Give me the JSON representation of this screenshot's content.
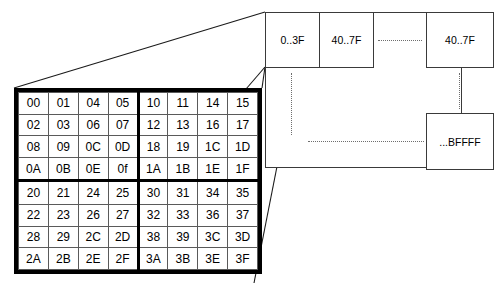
{
  "diagram": {
    "colors": {
      "outline": "#000000",
      "cell_border": "#5a5a5a",
      "panel_border": "#3a3a3a",
      "dotted": "#6e6e6e",
      "background": "#ffffff"
    }
  },
  "hex_grid": {
    "name": "address-block-grid",
    "rows": 8,
    "columns": 8,
    "quadrant_divider_after_column": 4,
    "quadrant_divider_after_row": 4,
    "cells": [
      [
        "00",
        "01",
        "04",
        "05",
        "10",
        "11",
        "14",
        "15"
      ],
      [
        "02",
        "03",
        "06",
        "07",
        "12",
        "13",
        "16",
        "17"
      ],
      [
        "08",
        "09",
        "0C",
        "0D",
        "18",
        "19",
        "1C",
        "1D"
      ],
      [
        "0A",
        "0B",
        "0E",
        "0f",
        "1A",
        "1B",
        "1E",
        "1F"
      ],
      [
        "20",
        "21",
        "24",
        "25",
        "30",
        "31",
        "34",
        "35"
      ],
      [
        "22",
        "23",
        "26",
        "27",
        "32",
        "33",
        "36",
        "37"
      ],
      [
        "28",
        "29",
        "2C",
        "2D",
        "38",
        "39",
        "3C",
        "3D"
      ],
      [
        "2A",
        "2B",
        "2E",
        "2F",
        "3A",
        "3B",
        "3E",
        "3F"
      ]
    ]
  },
  "memory_panel": {
    "name": "memory-map-panel",
    "blocks": [
      {
        "id": "block-0",
        "label": "0..3F"
      },
      {
        "id": "block-1",
        "label": "40..7F"
      },
      {
        "id": "block-2",
        "label": "40..7F"
      },
      {
        "id": "block-3",
        "label": "...BFFFF"
      }
    ],
    "ellipses": {
      "top_horizontal": ". . . . . . . .",
      "bottom_horizontal": ". . . . . . . . . . . . . . . . . . . .",
      "left_vertical": "vertical-ellipsis",
      "right_vertical": "vertical-ellipsis"
    }
  },
  "connectors": {
    "top_leader": "grid-top-left-to-panel-top-left",
    "mid_leader": "grid-top-right-to-panel-left-edge",
    "bottom_leader": "grid-bottom-right-to-panel-bottom-left"
  }
}
